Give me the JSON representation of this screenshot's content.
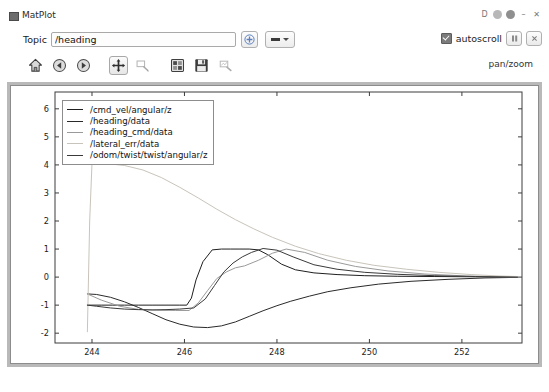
{
  "window": {
    "title": "MatPlot",
    "title_icon": "app-window-icon",
    "controls": {
      "detach": "D",
      "collapse_icon": "circle-icon",
      "help_icon": "help-circle-icon",
      "minimize": "–",
      "close": "✕"
    }
  },
  "topic": {
    "label": "Topic",
    "value": "/heading",
    "placeholder": "/heading",
    "add_button_icon": "plus-circle-icon",
    "dropdown_icon": "line-style-dropdown"
  },
  "options": {
    "autoscroll_label": "autoscroll",
    "autoscroll_checked": true,
    "pause_icon": "pause-icon",
    "clear_icon": "clear-icon"
  },
  "toolbar": {
    "mode_label": "pan/zoom",
    "buttons": [
      {
        "name": "home-icon",
        "label": "Home",
        "active": false
      },
      {
        "name": "back-arrow-icon",
        "label": "Back",
        "active": false
      },
      {
        "name": "forward-arrow-icon",
        "label": "Forward",
        "active": false
      },
      {
        "name": "pan-move-icon",
        "label": "Pan",
        "active": true
      },
      {
        "name": "zoom-rect-icon",
        "label": "Zoom",
        "active": false
      },
      {
        "name": "configure-subplots-icon",
        "label": "Subplots",
        "active": false
      },
      {
        "name": "save-floppy-icon",
        "label": "Save",
        "active": false
      },
      {
        "name": "edit-curves-icon",
        "label": "Edit",
        "active": false
      }
    ]
  },
  "chart_data": {
    "type": "line",
    "title": "",
    "xlabel": "",
    "ylabel": "",
    "grid": false,
    "legend_position": "upper left",
    "xlim": [
      243.2,
      253.3
    ],
    "ylim": [
      -2.35,
      6.6
    ],
    "xticks": [
      244,
      246,
      248,
      250,
      252
    ],
    "yticks": [
      -2,
      -1,
      0,
      1,
      2,
      3,
      4,
      5,
      6
    ],
    "series": [
      {
        "name": "/cmd_vel/angular/z",
        "color": "#1f1f1f",
        "x": [
          243.9,
          244.0,
          244.2,
          244.45,
          244.7,
          245.0,
          245.3,
          245.6,
          245.9,
          246.05,
          246.15,
          246.25,
          246.4,
          246.6,
          246.8,
          247.0,
          247.2,
          247.4,
          247.6,
          247.8,
          248.1,
          248.4,
          248.8,
          249.3,
          249.9,
          250.6,
          251.4,
          252.3,
          253.2
        ],
        "y": [
          -1.0,
          -1.0,
          -1.0,
          -1.0,
          -1.0,
          -1.0,
          -1.0,
          -1.0,
          -1.0,
          -1.0,
          -0.75,
          -0.1,
          0.55,
          0.97,
          1.0,
          1.0,
          1.0,
          1.0,
          0.97,
          0.8,
          0.46,
          0.26,
          0.15,
          0.09,
          0.05,
          0.03,
          0.02,
          0.01,
          0.0
        ]
      },
      {
        "name": "/heading/data",
        "color": "#2a2a2a",
        "x": [
          243.9,
          244.1,
          244.4,
          244.7,
          245.0,
          245.3,
          245.6,
          245.9,
          246.2,
          246.5,
          246.8,
          247.1,
          247.4,
          247.7,
          248.0,
          248.3,
          248.7,
          249.1,
          249.6,
          250.2,
          250.9,
          251.7,
          252.5,
          253.2
        ],
        "y": [
          -0.6,
          -0.62,
          -0.72,
          -0.88,
          -1.08,
          -1.3,
          -1.52,
          -1.68,
          -1.78,
          -1.8,
          -1.74,
          -1.6,
          -1.4,
          -1.2,
          -1.02,
          -0.86,
          -0.68,
          -0.52,
          -0.38,
          -0.25,
          -0.15,
          -0.08,
          -0.03,
          -0.01
        ]
      },
      {
        "name": "/heading_cmd/data",
        "color": "#9a9a9a",
        "x": [
          243.9,
          244.2,
          244.6,
          245.0,
          245.4,
          245.8,
          246.1,
          246.3,
          246.5,
          246.7,
          246.9,
          247.1,
          247.3,
          247.6,
          247.9,
          248.2,
          248.6,
          249.1,
          249.7,
          250.4,
          251.2,
          252.1,
          253.2
        ],
        "y": [
          -0.6,
          -0.82,
          -1.04,
          -1.15,
          -1.18,
          -1.19,
          -1.19,
          -0.92,
          -0.48,
          -0.05,
          0.18,
          0.33,
          0.4,
          0.6,
          0.85,
          1.0,
          0.88,
          0.6,
          0.38,
          0.22,
          0.11,
          0.04,
          0.0
        ]
      },
      {
        "name": "/lateral_err/data",
        "color": "#c9c4bb",
        "x": [
          243.9,
          243.95,
          244.0,
          244.3,
          244.7,
          245.1,
          245.5,
          245.9,
          246.3,
          246.7,
          247.1,
          247.5,
          247.9,
          248.4,
          248.9,
          249.5,
          250.1,
          250.8,
          251.5,
          252.2,
          252.8,
          253.2
        ],
        "y": [
          -1.95,
          2.0,
          4.05,
          4.05,
          3.98,
          3.82,
          3.55,
          3.2,
          2.82,
          2.42,
          2.05,
          1.72,
          1.42,
          1.1,
          0.84,
          0.6,
          0.42,
          0.28,
          0.17,
          0.09,
          0.04,
          0.02
        ]
      },
      {
        "name": "/odom/twist/twist/angular/z",
        "color": "#3a3a3a",
        "x": [
          243.9,
          244.1,
          244.4,
          244.7,
          245.0,
          245.3,
          245.6,
          245.9,
          246.2,
          246.45,
          246.65,
          246.85,
          247.05,
          247.25,
          247.45,
          247.7,
          248.0,
          248.35,
          248.8,
          249.3,
          249.9,
          250.6,
          251.4,
          252.3,
          253.2
        ],
        "y": [
          -1.0,
          -1.04,
          -1.1,
          -1.14,
          -1.16,
          -1.17,
          -1.16,
          -1.14,
          -1.1,
          -0.78,
          -0.3,
          0.18,
          0.5,
          0.72,
          0.88,
          1.02,
          0.96,
          0.72,
          0.44,
          0.28,
          0.17,
          0.1,
          0.05,
          0.02,
          0.0
        ]
      }
    ]
  }
}
